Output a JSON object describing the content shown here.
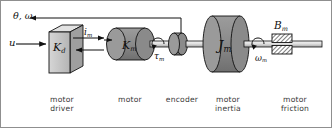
{
  "figure": {
    "kind": "dc-motor-block-schematic",
    "background": "#ffffff",
    "ink": "#111111",
    "body_fill": "#8a8a8a",
    "body_fill_light": "#bdbdbd",
    "shaft_fill": "#e8e8e8"
  },
  "signals": {
    "input": "u",
    "feedback": "θ, ω",
    "current": "i",
    "current_sub": "m",
    "torque": "τ",
    "torque_sub": "m",
    "speed": "ω",
    "speed_sub": "m"
  },
  "blocks": {
    "driver": {
      "symbol": "K",
      "sub": "d",
      "caption": "motor\ndriver"
    },
    "motor": {
      "symbol": "K",
      "sub": "m",
      "caption": "motor"
    },
    "encoder": {
      "symbol": "",
      "sub": "",
      "caption": "encoder"
    },
    "inertia": {
      "symbol": "J",
      "sub": "m",
      "caption": "motor\ninertia"
    },
    "friction": {
      "symbol": "B",
      "sub": "m",
      "caption": "motor\nfriction"
    }
  }
}
